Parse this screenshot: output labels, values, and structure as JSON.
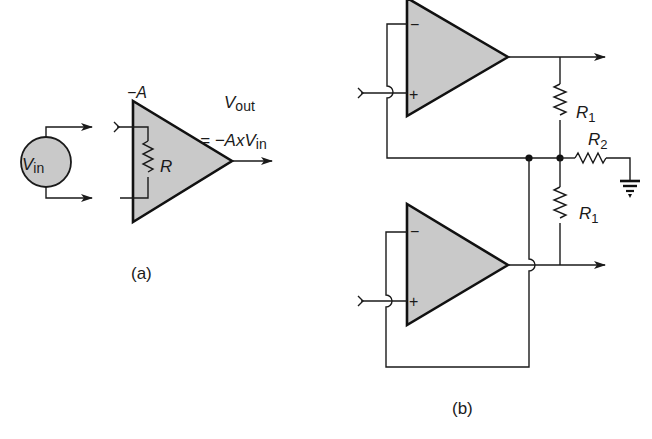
{
  "figure_a": {
    "source_label": "V",
    "source_sub": "in",
    "gain_label": "−A",
    "resistor_label": "R",
    "output_label": "V",
    "output_sub": "out",
    "equation_prefix": "= −AxV",
    "equation_sub": "in",
    "caption": "(a)"
  },
  "figure_b": {
    "top_amp": {
      "minus": "−",
      "plus": "+"
    },
    "bottom_amp": {
      "minus": "−",
      "plus": "+"
    },
    "r1_top_label": "R",
    "r1_top_sub": "1",
    "r1_bottom_label": "R",
    "r1_bottom_sub": "1",
    "r2_label": "R",
    "r2_sub": "2",
    "caption": "(b)"
  },
  "colors": {
    "amp_fill": "#c9c9c9",
    "line": "#1a1a1a",
    "background": "#ffffff"
  }
}
